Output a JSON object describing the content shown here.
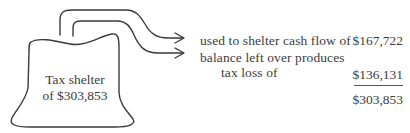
{
  "diagram": {
    "source": {
      "label_line1": "Tax shelter",
      "label_line2": "of $303,853",
      "shape": "bag-outline"
    },
    "arrows": [
      {
        "name": "arrow-to-cash-flow-shelter",
        "icon": "curved-arrow-right"
      },
      {
        "name": "arrow-to-tax-loss",
        "icon": "curved-arrow-right"
      }
    ],
    "breakdown": {
      "rows": [
        {
          "description_lines": [
            "used to shelter cash flow of"
          ],
          "amount": "$167,722"
        },
        {
          "description_lines": [
            "balance left over produces",
            "tax loss of"
          ],
          "amount": "$136,131"
        }
      ],
      "total": "$303,853"
    },
    "colors": {
      "stroke": "#3a3a3a",
      "text": "#3c3c3c",
      "background": "#ffffff"
    }
  }
}
